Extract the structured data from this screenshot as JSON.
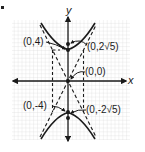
{
  "figure": {
    "type": "hyperbola-graph",
    "equation_implied": "y^2/16 - x^2/4 = 1",
    "axes": {
      "x_label": "x",
      "y_label": "y"
    },
    "labels": {
      "vertex_top": "(0,4)",
      "focus_top": "(0,2√5)",
      "center": "(0,0)",
      "vertex_bottom": "(0,-4)",
      "focus_bottom": "(0,-2√5)"
    },
    "points": [
      {
        "name": "vertex_top",
        "x": 0,
        "y": 4
      },
      {
        "name": "focus_top",
        "x": 0,
        "y": 4.472
      },
      {
        "name": "center",
        "x": 0,
        "y": 0
      },
      {
        "name": "vertex_bottom",
        "x": 0,
        "y": -4
      },
      {
        "name": "focus_bottom",
        "x": 0,
        "y": -4.472
      }
    ],
    "asymptotes": [
      "y = 2x",
      "y = -2x"
    ],
    "fundamental_rectangle": {
      "x": [
        -2,
        2
      ],
      "y": [
        -4,
        4
      ]
    },
    "colors": {
      "curve": "#1a1a1a",
      "grid": "#d6d6d6",
      "axes": "#1a1a1a",
      "background": "#ffffff"
    }
  }
}
